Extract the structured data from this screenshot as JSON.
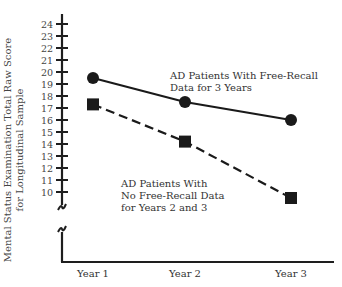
{
  "chart_data": {
    "type": "line",
    "title": "",
    "xlabel": "",
    "ylabel": "Mental Status Examination Total Raw Score for Longitudinal Sample",
    "ylabel_lines": [
      "Mental Status Examination Total Raw Score",
      "for Longitudinal Sample"
    ],
    "categories": [
      "Year 1",
      "Year 2",
      "Year 3"
    ],
    "y_ticks": [
      10,
      11,
      12,
      13,
      14,
      15,
      16,
      17,
      18,
      19,
      20,
      21,
      22,
      23,
      24
    ],
    "ylim": [
      10,
      24
    ],
    "y_axis_break": true,
    "grid": false,
    "series": [
      {
        "name": "AD Patients With Free-Recall Data for 3 Years",
        "label_lines": [
          "AD Patients With Free-Recall",
          "Data for 3 Years"
        ],
        "values": [
          19.5,
          17.5,
          16.0
        ],
        "marker": "circle",
        "line_style": "solid",
        "color": "#1a1a1a"
      },
      {
        "name": "AD Patients With No Free-Recall Data for Years 2 and 3",
        "label_lines": [
          "AD Patients With",
          "No Free-Recall Data",
          "for Years 2 and 3"
        ],
        "values": [
          17.3,
          14.2,
          9.5
        ],
        "marker": "square",
        "line_style": "dashed",
        "color": "#1a1a1a"
      }
    ]
  }
}
